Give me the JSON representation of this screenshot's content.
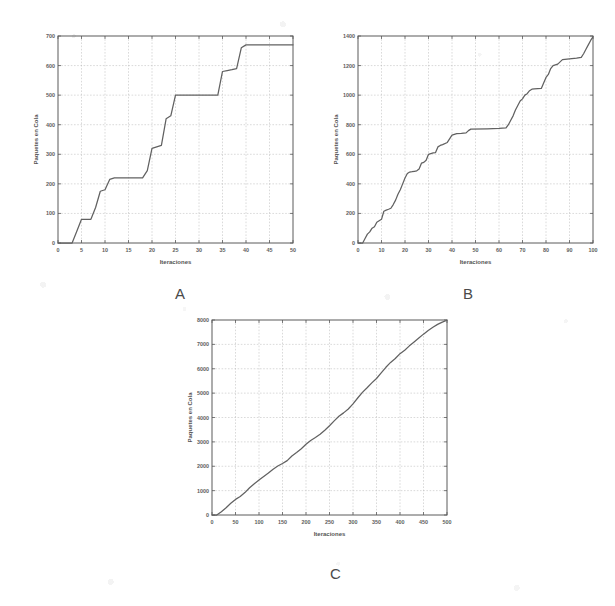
{
  "figure": {
    "background_color": "#ffffff",
    "line_color": "#616161",
    "grid_color": "#b4b4b4",
    "axis_color": "#5a5a5a"
  },
  "panels": [
    {
      "caption": "A"
    },
    {
      "caption": "B"
    },
    {
      "caption": "C"
    }
  ],
  "chart_data": [
    {
      "type": "line",
      "title": "",
      "panel_label": "A",
      "xlabel": "Iteraciones",
      "ylabel": "Paquetes en Cola",
      "xlim": [
        0,
        50
      ],
      "ylim": [
        0,
        700
      ],
      "xticks": [
        0,
        5,
        10,
        15,
        20,
        25,
        30,
        35,
        40,
        45,
        50
      ],
      "xtick_labels": [
        "0",
        "5",
        "10",
        "15",
        "20",
        "25",
        "30",
        "35",
        "40",
        "45",
        "50"
      ],
      "yticks": [
        0,
        100,
        200,
        300,
        400,
        500,
        600,
        700
      ],
      "ytick_labels": [
        "0",
        "100",
        "200",
        "300",
        "400",
        "500",
        "600",
        "700"
      ],
      "grid": true,
      "legend": "none",
      "series": [
        {
          "name": "Paquetes en Cola",
          "x": [
            0,
            3,
            4,
            5,
            6,
            7,
            8,
            9,
            10,
            11,
            12,
            13,
            14,
            15,
            16,
            17,
            18,
            19,
            20,
            21,
            22,
            23,
            24,
            25,
            26,
            27,
            28,
            29,
            30,
            31,
            32,
            33,
            34,
            35,
            36,
            37,
            38,
            39,
            40,
            41,
            45,
            50
          ],
          "y": [
            0,
            0,
            40,
            80,
            80,
            80,
            120,
            175,
            180,
            215,
            220,
            220,
            220,
            220,
            220,
            220,
            220,
            245,
            320,
            325,
            330,
            420,
            430,
            500,
            500,
            500,
            500,
            500,
            500,
            500,
            500,
            500,
            500,
            580,
            583,
            586,
            590,
            660,
            670,
            670,
            670,
            670
          ]
        }
      ]
    },
    {
      "type": "line",
      "title": "",
      "panel_label": "B",
      "xlabel": "Iteraciones",
      "ylabel": "Paquetes en Cola",
      "xlim": [
        0,
        100
      ],
      "ylim": [
        0,
        1400
      ],
      "xticks": [
        0,
        10,
        20,
        30,
        40,
        50,
        60,
        70,
        80,
        90,
        100
      ],
      "xtick_labels": [
        "0",
        "10",
        "20",
        "30",
        "40",
        "50",
        "60",
        "70",
        "80",
        "90",
        "100"
      ],
      "yticks": [
        0,
        200,
        400,
        600,
        800,
        1000,
        1200,
        1400
      ],
      "ytick_labels": [
        "0",
        "200",
        "400",
        "600",
        "800",
        "1000",
        "1200",
        "1400"
      ],
      "grid": true,
      "legend": "none",
      "series": [
        {
          "name": "Paquetes en Cola",
          "x": [
            0,
            2,
            3,
            4,
            5,
            6,
            7,
            8,
            9,
            10,
            11,
            12,
            13,
            14,
            15,
            16,
            17,
            18,
            19,
            20,
            21,
            22,
            23,
            24,
            25,
            26,
            27,
            28,
            29,
            30,
            31,
            32,
            33,
            34,
            35,
            36,
            38,
            40,
            41,
            42,
            44,
            46,
            47,
            48,
            55,
            60,
            63,
            64,
            65,
            66,
            67,
            68,
            69,
            70,
            71,
            72,
            73,
            74,
            75,
            78,
            80,
            81,
            82,
            83,
            85,
            87,
            88,
            90,
            93,
            95,
            96,
            97,
            98,
            99,
            100
          ],
          "y": [
            0,
            0,
            30,
            60,
            75,
            100,
            110,
            140,
            150,
            160,
            215,
            222,
            228,
            235,
            260,
            290,
            330,
            360,
            400,
            440,
            470,
            480,
            482,
            485,
            488,
            500,
            540,
            545,
            560,
            600,
            605,
            610,
            612,
            650,
            660,
            665,
            680,
            730,
            735,
            740,
            742,
            745,
            760,
            770,
            772,
            775,
            778,
            800,
            830,
            860,
            900,
            930,
            960,
            975,
            1000,
            1010,
            1030,
            1040,
            1042,
            1045,
            1120,
            1140,
            1180,
            1200,
            1210,
            1240,
            1242,
            1245,
            1250,
            1255,
            1280,
            1310,
            1340,
            1370,
            1395
          ]
        }
      ]
    },
    {
      "type": "line",
      "title": "",
      "panel_label": "C",
      "xlabel": "Iteraciones",
      "ylabel": "Paquetes en Cola",
      "xlim": [
        0,
        500
      ],
      "ylim": [
        0,
        8000
      ],
      "xticks": [
        0,
        50,
        100,
        150,
        200,
        250,
        300,
        350,
        400,
        450,
        500
      ],
      "xtick_labels": [
        "0",
        "50",
        "100",
        "150",
        "200",
        "250",
        "300",
        "350",
        "400",
        "450",
        "500"
      ],
      "yticks": [
        0,
        1000,
        2000,
        3000,
        4000,
        5000,
        6000,
        7000,
        8000
      ],
      "ytick_labels": [
        "0",
        "1000",
        "2000",
        "3000",
        "4000",
        "5000",
        "6000",
        "7000",
        "8000"
      ],
      "grid": true,
      "legend": "none",
      "series": [
        {
          "name": "Paquetes en Cola",
          "x": [
            0,
            10,
            20,
            30,
            40,
            50,
            60,
            70,
            80,
            90,
            100,
            110,
            120,
            130,
            140,
            150,
            160,
            170,
            180,
            190,
            200,
            210,
            220,
            230,
            240,
            250,
            260,
            270,
            280,
            290,
            300,
            310,
            320,
            330,
            340,
            350,
            360,
            370,
            380,
            390,
            400,
            410,
            420,
            430,
            440,
            450,
            460,
            470,
            480,
            490,
            500
          ],
          "y": [
            0,
            0,
            130,
            300,
            480,
            640,
            760,
            920,
            1120,
            1280,
            1440,
            1580,
            1720,
            1880,
            2010,
            2110,
            2230,
            2420,
            2560,
            2720,
            2900,
            3060,
            3180,
            3310,
            3480,
            3660,
            3860,
            4050,
            4190,
            4350,
            4560,
            4800,
            5030,
            5220,
            5420,
            5600,
            5830,
            6060,
            6260,
            6420,
            6620,
            6760,
            6940,
            7100,
            7260,
            7420,
            7570,
            7700,
            7820,
            7910,
            7990
          ]
        }
      ]
    }
  ]
}
